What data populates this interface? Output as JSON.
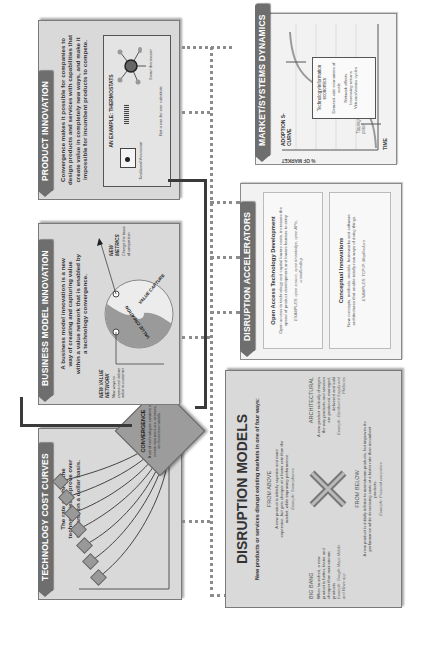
{
  "orientation": "rotated 90 degrees counter-clockwise",
  "technology_cost_curves": {
    "title": "TECHNOLOGY COST CURVES",
    "description": "The rate at which the technologies improve over time and on a dollar basis.",
    "icon_count": 7
  },
  "convergence": {
    "title": "CONVERGENCE",
    "description": "A set of technologies combine to create new products, services, and business models"
  },
  "business_model_innovation": {
    "title": "BUSINESS MODEL INNOVATION",
    "description": "A business model innovation is a new way of creating and capturing value within a value network that is enabled by a technology convergence.",
    "new_value_network": {
      "title": "NEW VALUE NETWORK",
      "text": "New ways to create and deliver value to customer"
    },
    "value_creation_label": "VALUE CREATION",
    "value_capture_label": "VALUE CAPTURE",
    "new_metrics": {
      "title": "NEW METRICS",
      "text": "Change the basis of competition"
    }
  },
  "product_innovation": {
    "title": "PRODUCT INNOVATION",
    "description": "Convergence makes it possible for companies to design products and services with capabilities that create value in completely new ways, and make it impossible for incumbent products to compete.",
    "example": {
      "title": "AN EXAMPLE: THERMOSTATS",
      "left_label": "Traditional thermostat",
      "right_label": "Smart thermostat",
      "footer": "Not a one-for-one substitute"
    }
  },
  "disruption_models": {
    "title": "DISRUPTION MODELS",
    "subtitle": "New products or services disrupt existing markets in one of four ways:",
    "from_above": {
      "title": "FROM ABOVE",
      "text": "A new product is initially superior and more expensive, but gets cheaper at a faster rate than the market, while improving performance",
      "example": "Example: Smartphones"
    },
    "big_bang": {
      "title": "BIG BANG",
      "text": "When launched, a new product is better, faster and cheaper than mainstream products",
      "example": "Example: Google Maps Mobile and Waze app"
    },
    "architectural": {
      "title": "ARCHITECTURAL",
      "text": "A new product radically changes the way products and services are produced, managed, delivered and sold",
      "example": "Example: Distributed Supply and Platforms"
    },
    "from_below": {
      "title": "FROM BELOW",
      "text": "A new product is initially inferior to mainstream products, but improves its performance while decreasing costs at a faster rate than incumbent products.",
      "example": "Example: Personal computers"
    }
  },
  "disruption_accelerators": {
    "title": "DISRUPTION ACCELERATORS",
    "open_access": {
      "title": "Open Access Technology Development",
      "text": "Open access to technology and capital lowers costs, increases the speed of product development and lowers barriers to entry",
      "example": "EXAMPLES: open source, open knowledge, open APIs, crowdfunding"
    },
    "conceptual": {
      "title": "Conceptual Innovations",
      "text": "New concepts, methods, models, frameworks and software architectures that enable totally new ways of doing things.",
      "example": "EXAMPLES: TCP/IP, MapReduce"
    }
  },
  "market_systems_dynamics": {
    "title": "MARKET/SYSTEMS DYNAMICS",
    "y_axis_label": "% OF MARKET",
    "x_axis_label": "TIME",
    "curve_label": "ADOPTION S-CURVE",
    "growth_label": "Exponential Growth",
    "tipping_label": "Tipping point",
    "callout": {
      "title": "Technology/information economics:",
      "items": [
        "Demand-side economies of scale",
        "Network effects",
        "Increasing returns",
        "Virtuous/vicious cycles"
      ]
    }
  },
  "colors": {
    "panel_fill": "#d9d9d9",
    "tab_fill": "#6e6e6e",
    "connector": "#3a3a3a",
    "dotted_line": "#8c8c8c",
    "light_panel": "#f2f2f2"
  }
}
